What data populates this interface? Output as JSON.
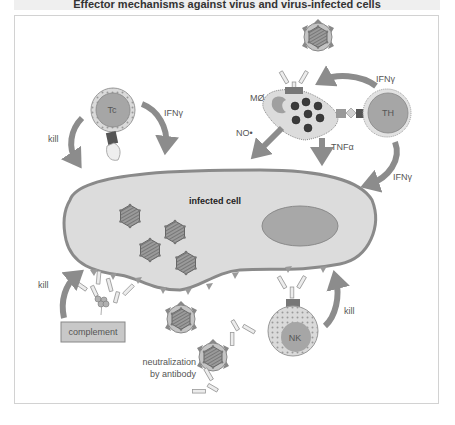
{
  "title": "Effector mechanisms against virus and virus-infected cells",
  "colors": {
    "cell_fill": "#dcdcdc",
    "cell_stroke": "#8a8a8a",
    "nucleus": "#a8a8a8",
    "arrow": "#8c8c8c",
    "lymphocyte": "#a6a6a6",
    "complement_box": "#c8c8c8"
  },
  "labels": {
    "infected_cell": "infected cell",
    "tc": "Tc",
    "th": "TH",
    "macrophage": "MØ",
    "nk": "NK",
    "complement": "complement",
    "neutralization_line1": "neutralization",
    "neutralization_line2": "by antibody",
    "kill_tc": "kill",
    "ifn_tc": "IFNγ",
    "ifn_th_to_m": "IFNγ",
    "ifn_th_to_cell": "IFNγ",
    "no": "NO•",
    "tnf": "TNFα",
    "kill_nk": "kill",
    "kill_complement": "kill"
  }
}
